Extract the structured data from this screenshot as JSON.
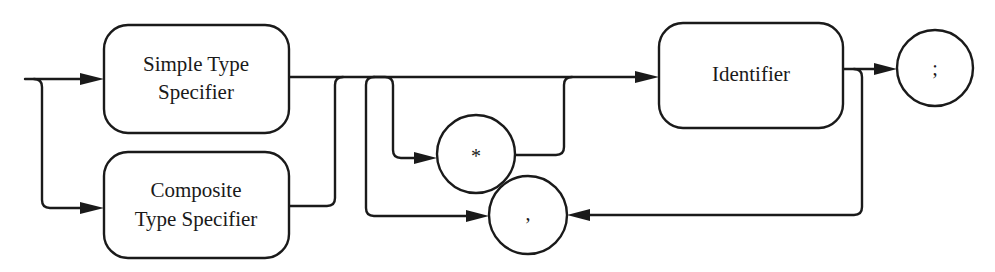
{
  "diagram": {
    "type": "syntax-railroad-diagram",
    "nodes": {
      "simple_type_specifier": {
        "kind": "nonterminal",
        "line1": "Simple Type",
        "line2": "Specifier"
      },
      "composite_type_specifier": {
        "kind": "nonterminal",
        "line1": "Composite",
        "line2": "Type Specifier"
      },
      "identifier": {
        "kind": "nonterminal",
        "label": "Identifier"
      },
      "pointer": {
        "kind": "terminal",
        "label": "*"
      },
      "comma": {
        "kind": "terminal",
        "label": ","
      },
      "semicolon": {
        "kind": "terminal",
        "label": ";"
      }
    },
    "edges": [
      {
        "from": "start",
        "to": "simple_type_specifier"
      },
      {
        "from": "start",
        "to": "composite_type_specifier"
      },
      {
        "from": "simple_type_specifier",
        "to": "identifier"
      },
      {
        "from": "composite_type_specifier",
        "to": "identifier"
      },
      {
        "from": "simple_type_specifier",
        "to": "pointer",
        "note": "optional branch"
      },
      {
        "from": "pointer",
        "to": "identifier"
      },
      {
        "from": "identifier",
        "to": "semicolon"
      },
      {
        "from": "identifier",
        "to": "comma",
        "note": "loop back"
      },
      {
        "from": "comma",
        "to": "identifier",
        "note": "repeat via branch"
      }
    ],
    "colors": {
      "stroke": "#1a1a1a",
      "background": "#ffffff"
    }
  }
}
